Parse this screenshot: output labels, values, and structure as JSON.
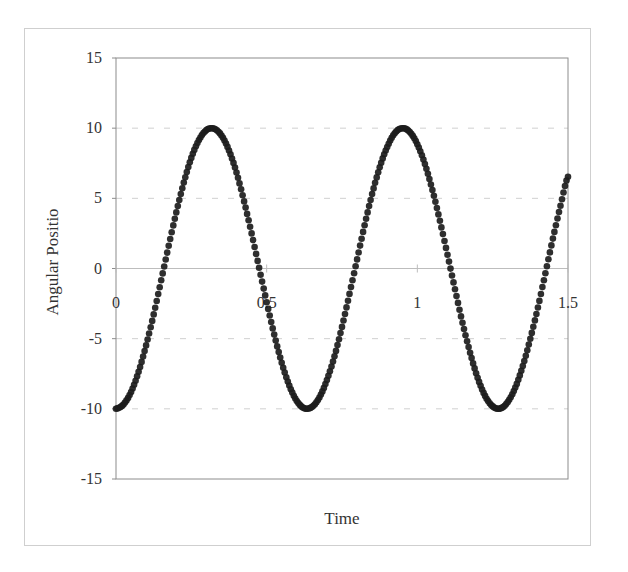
{
  "chart_data": {
    "type": "scatter",
    "title": "",
    "xlabel": "Time",
    "ylabel": "Angular Positio",
    "xlim": [
      0,
      1.5
    ],
    "ylim": [
      -15,
      15
    ],
    "x_ticks": [
      "0",
      "0.5",
      "1",
      "1.5"
    ],
    "x_tick_values": [
      0,
      0.5,
      1,
      1.5
    ],
    "y_ticks": [
      "15",
      "10",
      "5",
      "0",
      "-5",
      "-10",
      "-15"
    ],
    "y_tick_values": [
      15,
      10,
      5,
      0,
      -5,
      -10,
      -15
    ],
    "grid": "horizontal dashed",
    "legend": "none",
    "marker_color": "#1c1c1c",
    "series": [
      {
        "name": "Angular Position",
        "x": [
          0,
          0.025,
          0.05,
          0.075,
          0.1,
          0.125,
          0.15,
          0.175,
          0.2,
          0.225,
          0.25,
          0.275,
          0.3,
          0.325,
          0.35,
          0.375,
          0.4,
          0.425,
          0.45,
          0.475,
          0.5,
          0.525,
          0.55,
          0.575,
          0.6,
          0.625,
          0.65,
          0.675,
          0.7,
          0.725,
          0.75,
          0.775,
          0.8,
          0.825,
          0.85,
          0.875,
          0.9,
          0.925,
          0.95,
          0.975,
          1.0,
          1.025,
          1.05,
          1.075,
          1.1,
          1.125,
          1.15,
          1.175,
          1.2,
          1.225,
          1.25,
          1.275,
          1.3,
          1.325,
          1.35,
          1.375,
          1.4,
          1.425,
          1.45,
          1.475,
          1.5
        ],
        "values": [
          -10,
          -9.69,
          -8.8,
          -7.36,
          -5.48,
          -3.27,
          -0.84,
          1.62,
          4.0,
          6.12,
          7.88,
          9.15,
          9.86,
          9.97,
          9.48,
          8.41,
          6.84,
          4.78,
          2.5,
          0.05,
          -2.4,
          -4.71,
          -6.72,
          -8.34,
          -9.44,
          -9.96,
          -9.87,
          -9.19,
          -7.95,
          -6.26,
          -4.16,
          -1.81,
          0.65,
          3.08,
          5.3,
          7.21,
          8.66,
          9.64,
          10.0,
          9.73,
          8.86,
          7.44,
          5.59,
          3.4,
          0.98,
          -1.48,
          -3.87,
          -6.0,
          -7.78,
          -9.08,
          -9.83,
          -9.98,
          -9.52,
          -8.49,
          -6.95,
          -5.01,
          -2.78,
          -0.34,
          2.13,
          4.47,
          6.54
        ]
      }
    ]
  }
}
